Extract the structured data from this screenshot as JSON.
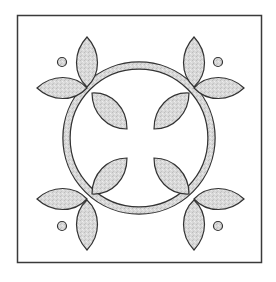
{
  "figure": {
    "colors": {
      "background": "#ffffff",
      "stroke": "#333333",
      "fill": "#d6d6d6",
      "frame": "#3a3a3a"
    },
    "frame": {
      "x": 17,
      "y": 15,
      "width": 245,
      "height": 248
    },
    "ring": {
      "cx": 139,
      "cy": 138,
      "outer_r": 76,
      "inner_r": 69
    },
    "dots": [
      {
        "cx": 62,
        "cy": 62,
        "r": 4.5
      },
      {
        "cx": 218,
        "cy": 62,
        "r": 4.5
      },
      {
        "cx": 62,
        "cy": 226,
        "r": 4.5
      },
      {
        "cx": 218,
        "cy": 226,
        "r": 4.5
      }
    ]
  }
}
